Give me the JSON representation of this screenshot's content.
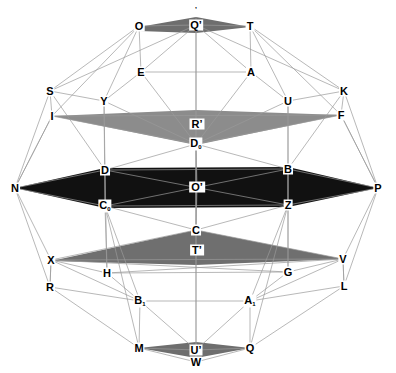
{
  "figure": {
    "type": "geometric-diagram",
    "background_color": "#ffffff",
    "edge_color": "#9a9a9a",
    "label_color": "#000000",
    "width": 396,
    "height": 373
  },
  "palette": {
    "band_top_sliver": "#6e6e6e",
    "band_upper": "#8c8c8c",
    "band_center": "#111111",
    "band_lower": "#6f6f6f",
    "band_bottom_sliver": "#6e6e6e",
    "edge": "#9a9a9a",
    "edge_dark": "#555555",
    "label_bg": "#ffffff",
    "label_fg": "#000000"
  },
  "vertices": [
    {
      "id": "Jmark",
      "label": "’",
      "x": 196,
      "y": 9,
      "boxed": false,
      "tiny": true
    },
    {
      "id": "O",
      "label": "O",
      "x": 139,
      "y": 26,
      "boxed": false
    },
    {
      "id": "Qp",
      "label": "Q’",
      "x": 196,
      "y": 25,
      "boxed": false
    },
    {
      "id": "T",
      "label": "T",
      "x": 250,
      "y": 26,
      "boxed": false
    },
    {
      "id": "E",
      "label": "E",
      "x": 141,
      "y": 72,
      "boxed": false
    },
    {
      "id": "A",
      "label": "A",
      "x": 251,
      "y": 72,
      "boxed": false
    },
    {
      "id": "S",
      "label": "S",
      "x": 50,
      "y": 91,
      "boxed": false
    },
    {
      "id": "K",
      "label": "K",
      "x": 344,
      "y": 91,
      "boxed": false
    },
    {
      "id": "Y",
      "label": "Y",
      "x": 104,
      "y": 101,
      "boxed": false
    },
    {
      "id": "U",
      "label": "U",
      "x": 288,
      "y": 101,
      "boxed": false
    },
    {
      "id": "I",
      "label": "I",
      "x": 52,
      "y": 116,
      "boxed": false
    },
    {
      "id": "F",
      "label": "F",
      "x": 341,
      "y": 115,
      "boxed": false
    },
    {
      "id": "Rp",
      "label": "R’",
      "x": 197,
      "y": 124,
      "boxed": true
    },
    {
      "id": "D0",
      "label": "D",
      "sub": "0",
      "x": 196,
      "y": 144,
      "boxed": false
    },
    {
      "id": "D",
      "label": "D",
      "x": 105,
      "y": 170,
      "boxed": false
    },
    {
      "id": "B",
      "label": "B",
      "x": 288,
      "y": 169,
      "boxed": false
    },
    {
      "id": "N",
      "label": "N",
      "x": 15,
      "y": 188,
      "boxed": false
    },
    {
      "id": "P",
      "label": "P",
      "x": 378,
      "y": 188,
      "boxed": false
    },
    {
      "id": "Op",
      "label": "O’",
      "x": 197,
      "y": 187,
      "boxed": true
    },
    {
      "id": "C0",
      "label": "C",
      "sub": "0",
      "x": 105,
      "y": 206,
      "boxed": false
    },
    {
      "id": "Z",
      "label": "Z",
      "x": 288,
      "y": 205,
      "boxed": false
    },
    {
      "id": "C",
      "label": "C",
      "x": 196,
      "y": 230,
      "boxed": false
    },
    {
      "id": "Tp",
      "label": "T’",
      "x": 197,
      "y": 250,
      "boxed": true
    },
    {
      "id": "X",
      "label": "X",
      "x": 51,
      "y": 260,
      "boxed": false
    },
    {
      "id": "V",
      "label": "V",
      "x": 343,
      "y": 259,
      "boxed": false
    },
    {
      "id": "H",
      "label": "H",
      "x": 107,
      "y": 273,
      "boxed": false
    },
    {
      "id": "G",
      "label": "G",
      "x": 288,
      "y": 272,
      "boxed": false
    },
    {
      "id": "R",
      "label": "R",
      "x": 50,
      "y": 287,
      "boxed": false
    },
    {
      "id": "L",
      "label": "L",
      "x": 344,
      "y": 286,
      "boxed": false
    },
    {
      "id": "B1",
      "label": "B",
      "sub": "1",
      "x": 140,
      "y": 301,
      "boxed": false
    },
    {
      "id": "A1",
      "label": "A",
      "sub": "1",
      "x": 250,
      "y": 301,
      "boxed": false
    },
    {
      "id": "M",
      "label": "M",
      "x": 139,
      "y": 348,
      "boxed": false
    },
    {
      "id": "Up",
      "label": "U’",
      "x": 196,
      "y": 350,
      "boxed": false
    },
    {
      "id": "Q",
      "label": "Q",
      "x": 250,
      "y": 348,
      "boxed": false
    },
    {
      "id": "W",
      "label": "W",
      "x": 196,
      "y": 362,
      "boxed": false
    }
  ],
  "bands": [
    {
      "name": "top-sliver-band",
      "fill": "#6e6e6e",
      "points": "139,27 196,17 250,27 196,33 139,31"
    },
    {
      "name": "upper-gray-band",
      "fill": "#8c8c8c",
      "points": "52,116 196,110 341,115 196,145"
    },
    {
      "name": "center-black-band",
      "fill": "#111111",
      "points": "15,188 105,168 288,167 378,188 288,207 105,208"
    },
    {
      "name": "lower-gray-band",
      "fill": "#6f6f6f",
      "points": "51,261 196,230 343,259 196,265"
    },
    {
      "name": "bottom-sliver-band",
      "fill": "#6e6e6e",
      "points": "139,348 196,342 250,348 196,358"
    }
  ],
  "edges": [
    [
      "O",
      "Qp"
    ],
    [
      "Qp",
      "T"
    ],
    [
      "O",
      "S"
    ],
    [
      "T",
      "K"
    ],
    [
      "O",
      "Y"
    ],
    [
      "T",
      "U"
    ],
    [
      "O",
      "I"
    ],
    [
      "T",
      "F"
    ],
    [
      "Qp",
      "E"
    ],
    [
      "Qp",
      "A"
    ],
    [
      "E",
      "A"
    ],
    [
      "S",
      "I"
    ],
    [
      "K",
      "F"
    ],
    [
      "S",
      "Y"
    ],
    [
      "K",
      "U"
    ],
    [
      "S",
      "N"
    ],
    [
      "K",
      "P"
    ],
    [
      "I",
      "N"
    ],
    [
      "F",
      "P"
    ],
    [
      "E",
      "Y"
    ],
    [
      "A",
      "U"
    ],
    [
      "E",
      "D0"
    ],
    [
      "A",
      "D0"
    ],
    [
      "I",
      "D0"
    ],
    [
      "F",
      "D0"
    ],
    [
      "I",
      "F"
    ],
    [
      "Y",
      "D"
    ],
    [
      "U",
      "B"
    ],
    [
      "Y",
      "D0"
    ],
    [
      "U",
      "D0"
    ],
    [
      "S",
      "D"
    ],
    [
      "K",
      "B"
    ],
    [
      "D0",
      "D"
    ],
    [
      "D0",
      "B"
    ],
    [
      "D0",
      "C"
    ],
    [
      "N",
      "D"
    ],
    [
      "P",
      "B"
    ],
    [
      "N",
      "C0"
    ],
    [
      "P",
      "Z"
    ],
    [
      "D",
      "B"
    ],
    [
      "C0",
      "Z"
    ],
    [
      "D",
      "C0"
    ],
    [
      "B",
      "Z"
    ],
    [
      "D",
      "Z"
    ],
    [
      "B",
      "C0"
    ],
    [
      "C",
      "C0"
    ],
    [
      "C",
      "Z"
    ],
    [
      "C",
      "X"
    ],
    [
      "C",
      "V"
    ],
    [
      "N",
      "X"
    ],
    [
      "P",
      "V"
    ],
    [
      "X",
      "R"
    ],
    [
      "V",
      "L"
    ],
    [
      "C0",
      "H"
    ],
    [
      "Z",
      "G"
    ],
    [
      "X",
      "H"
    ],
    [
      "V",
      "G"
    ],
    [
      "X",
      "V"
    ],
    [
      "X",
      "G"
    ],
    [
      "V",
      "H"
    ],
    [
      "R",
      "N"
    ],
    [
      "L",
      "P"
    ],
    [
      "R",
      "B1"
    ],
    [
      "L",
      "A1"
    ],
    [
      "H",
      "B1"
    ],
    [
      "G",
      "A1"
    ],
    [
      "B1",
      "A1"
    ],
    [
      "B1",
      "M"
    ],
    [
      "A1",
      "Q"
    ],
    [
      "R",
      "M"
    ],
    [
      "L",
      "Q"
    ],
    [
      "M",
      "Up"
    ],
    [
      "Up",
      "Q"
    ],
    [
      "M",
      "W"
    ],
    [
      "W",
      "Q"
    ],
    [
      "B1",
      "Up"
    ],
    [
      "A1",
      "Up"
    ],
    [
      "C0",
      "M"
    ],
    [
      "Z",
      "Q"
    ],
    [
      "X",
      "B1"
    ],
    [
      "V",
      "A1"
    ],
    [
      "Qp",
      "W"
    ],
    [
      "D0",
      "Op"
    ],
    [
      "Op",
      "C"
    ],
    [
      "Y",
      "C0"
    ],
    [
      "U",
      "Z"
    ],
    [
      "E",
      "O"
    ],
    [
      "A",
      "T"
    ],
    [
      "H",
      "G"
    ],
    [
      "R",
      "X"
    ],
    [
      "L",
      "V"
    ],
    [
      "S",
      "Qp"
    ],
    [
      "K",
      "Qp"
    ],
    [
      "N",
      "I"
    ],
    [
      "P",
      "F"
    ],
    [
      "C0",
      "B1"
    ],
    [
      "Z",
      "A1"
    ],
    [
      "D",
      "H"
    ],
    [
      "B",
      "G"
    ]
  ],
  "axis": {
    "name": "vertical-center-axis",
    "x": 196,
    "y1": 17,
    "y2": 358
  }
}
